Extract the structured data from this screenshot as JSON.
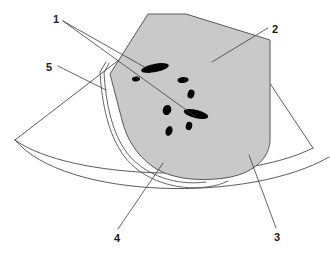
{
  "figure": {
    "kind": "ultrasound-sector-scan-diagram",
    "background_color": "#ffffff",
    "line_color": "#3c3c3c",
    "lesion_color": "#000000",
    "shaded_region_fill": "#c8c8c8",
    "shaded_region_stroke": "#555555"
  },
  "callouts": [
    {
      "id": "1",
      "label": "1",
      "x": 53,
      "y": 14
    },
    {
      "id": "2",
      "label": "2",
      "x": 272,
      "y": 24
    },
    {
      "id": "5",
      "label": "5",
      "x": 46,
      "y": 62
    },
    {
      "id": "4",
      "label": "4",
      "x": 114,
      "y": 233
    },
    {
      "id": "3",
      "label": "3",
      "x": 274,
      "y": 232
    }
  ],
  "lesions": [
    {
      "name": "lesion-large-upper",
      "cx": 155,
      "cy": 68,
      "rx": 14,
      "ry": 4.2,
      "rot": -11
    },
    {
      "name": "lesion-small-left",
      "cx": 136,
      "cy": 79,
      "rx": 4.0,
      "ry": 2.4,
      "rot": -8
    },
    {
      "name": "lesion-small-right-upper",
      "cx": 183,
      "cy": 80,
      "rx": 5.6,
      "ry": 3.0,
      "rot": -6
    },
    {
      "name": "lesion-small-mid-right",
      "cx": 191,
      "cy": 94,
      "rx": 3.4,
      "ry": 4.4,
      "rot": 18
    },
    {
      "name": "lesion-small-mid-left",
      "cx": 167,
      "cy": 110,
      "rx": 4.2,
      "ry": 5.2,
      "rot": 20
    },
    {
      "name": "lesion-large-lower",
      "cx": 196,
      "cy": 114,
      "rx": 12.5,
      "ry": 4.2,
      "rot": 14
    },
    {
      "name": "lesion-small-lower-right",
      "cx": 189,
      "cy": 126,
      "rx": 3.2,
      "ry": 4.2,
      "rot": 14
    },
    {
      "name": "lesion-small-lower-left",
      "cx": 169,
      "cy": 131,
      "rx": 3.4,
      "ry": 5.0,
      "rot": 18
    }
  ]
}
